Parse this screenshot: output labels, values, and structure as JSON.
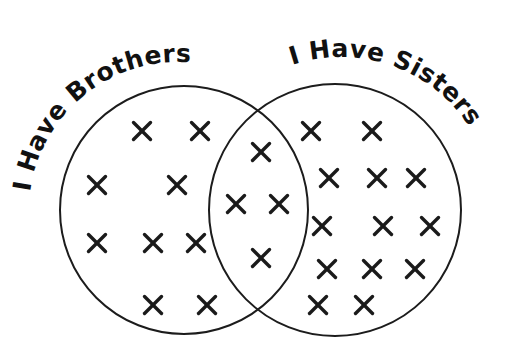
{
  "diagram": {
    "type": "venn",
    "colors": {
      "background": "#ffffff",
      "outline": "#1c1c1c",
      "marks": "#1a1a1a",
      "text": "#111111"
    },
    "sets": [
      {
        "id": "brothers",
        "label": "I Have Brothers",
        "circle": {
          "cx": 184,
          "cy": 210,
          "r": 124
        }
      },
      {
        "id": "sisters",
        "label": "I Have Sisters",
        "circle": {
          "cx": 335,
          "cy": 210,
          "r": 126
        }
      }
    ],
    "mark_symbol": "×",
    "regions": [
      {
        "id": "brothers-only",
        "count": 9,
        "marks": [
          [
            142,
            131
          ],
          [
            200,
            131
          ],
          [
            97,
            185
          ],
          [
            177,
            185
          ],
          [
            97,
            243
          ],
          [
            153,
            243
          ],
          [
            196,
            243
          ],
          [
            153,
            305
          ],
          [
            207,
            305
          ]
        ]
      },
      {
        "id": "both",
        "count": 4,
        "marks": [
          [
            261,
            152
          ],
          [
            236,
            204
          ],
          [
            279,
            204
          ],
          [
            261,
            258
          ]
        ]
      },
      {
        "id": "sisters-only",
        "count": 13,
        "marks": [
          [
            311,
            131
          ],
          [
            372,
            131
          ],
          [
            329,
            178
          ],
          [
            377,
            178
          ],
          [
            416,
            178
          ],
          [
            322,
            226
          ],
          [
            383,
            226
          ],
          [
            430,
            226
          ],
          [
            327,
            269
          ],
          [
            372,
            269
          ],
          [
            415,
            269
          ],
          [
            318,
            305
          ],
          [
            364,
            305
          ]
        ]
      }
    ]
  }
}
